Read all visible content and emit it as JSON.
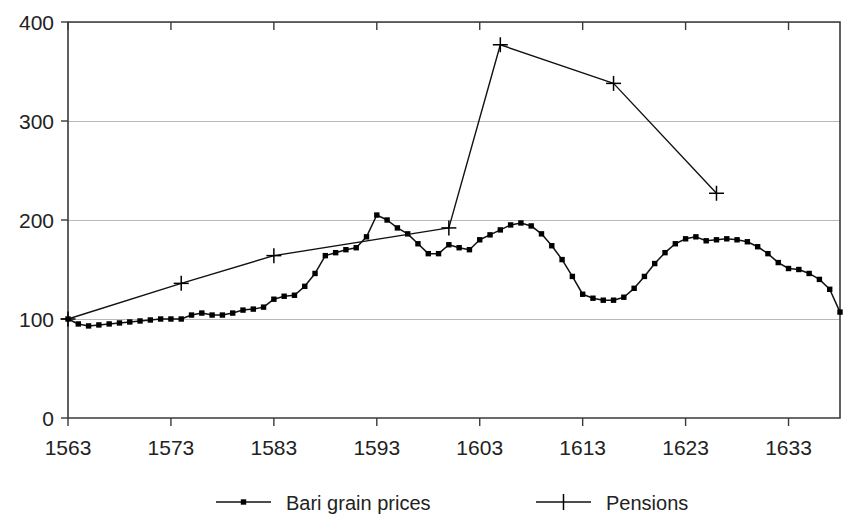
{
  "chart_data": {
    "type": "line",
    "title": "",
    "xlabel": "",
    "ylabel": "",
    "xlim": [
      1563,
      1638
    ],
    "ylim": [
      0,
      400
    ],
    "grid": true,
    "legend_position": "bottom",
    "y_ticks": [
      0,
      100,
      200,
      300,
      400
    ],
    "y_tick_labels": [
      "0",
      "100",
      "200",
      "300",
      "400"
    ],
    "x_ticks": [
      1563,
      1573,
      1583,
      1593,
      1603,
      1613,
      1623,
      1633
    ],
    "x_tick_labels": [
      "1563",
      "1573",
      "1583",
      "1593",
      "1603",
      "1613",
      "1623",
      "1633"
    ],
    "series": [
      {
        "name": "Bari grain prices",
        "marker": "dot",
        "x": [
          1563,
          1564,
          1565,
          1566,
          1567,
          1568,
          1569,
          1570,
          1571,
          1572,
          1573,
          1574,
          1575,
          1576,
          1577,
          1578,
          1579,
          1580,
          1581,
          1582,
          1583,
          1584,
          1585,
          1586,
          1587,
          1588,
          1589,
          1590,
          1591,
          1592,
          1593,
          1594,
          1595,
          1596,
          1597,
          1598,
          1599,
          1600,
          1601,
          1602,
          1603,
          1604,
          1605,
          1606,
          1607,
          1608,
          1609,
          1610,
          1611,
          1612,
          1613,
          1614,
          1615,
          1616,
          1617,
          1618,
          1619,
          1620,
          1621,
          1622,
          1623,
          1624,
          1625,
          1626,
          1627,
          1628,
          1629,
          1630,
          1631,
          1632,
          1633,
          1634,
          1635,
          1636,
          1637,
          1638
        ],
        "values": [
          100,
          95,
          93,
          94,
          95,
          96,
          97,
          98,
          99,
          100,
          100,
          100,
          104,
          106,
          104,
          104,
          106,
          109,
          110,
          112,
          120,
          123,
          124,
          133,
          146,
          164,
          167,
          170,
          172,
          183,
          205,
          200,
          192,
          186,
          176,
          166,
          166,
          175,
          172,
          170,
          180,
          185,
          190,
          195,
          197,
          194,
          186,
          174,
          160,
          143,
          125,
          121,
          119,
          119,
          122,
          131,
          143,
          156,
          167,
          176,
          181,
          183,
          179,
          180,
          181,
          180,
          178,
          173,
          166,
          157,
          151,
          150,
          146,
          140,
          130,
          107
        ]
      },
      {
        "name": "Pensions",
        "marker": "plus",
        "x": [
          1563,
          1574,
          1583,
          1600,
          1605,
          1616,
          1626
        ],
        "values": [
          100,
          136,
          164,
          192,
          377,
          338,
          227
        ]
      }
    ]
  },
  "legend": {
    "items": [
      {
        "label": "Bari grain prices",
        "marker": "dot"
      },
      {
        "label": "Pensions",
        "marker": "plus"
      }
    ]
  }
}
